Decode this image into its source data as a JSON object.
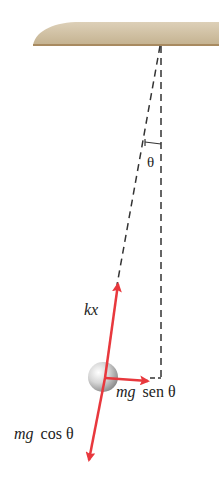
{
  "diagram": {
    "type": "pendulum-free-body",
    "colors": {
      "ceiling": "#c9b898",
      "ceiling_edge": "#a88a60",
      "force": "#e8383d",
      "dashed": "#333333",
      "ball": "#c8c8c8"
    },
    "labels": {
      "angle": "θ",
      "spring_force": "kx",
      "tangential_force_mg": "mg",
      "tangential_force_trig": "sen θ",
      "radial_force_mg": "mg",
      "radial_force_trig": "cos θ"
    }
  }
}
